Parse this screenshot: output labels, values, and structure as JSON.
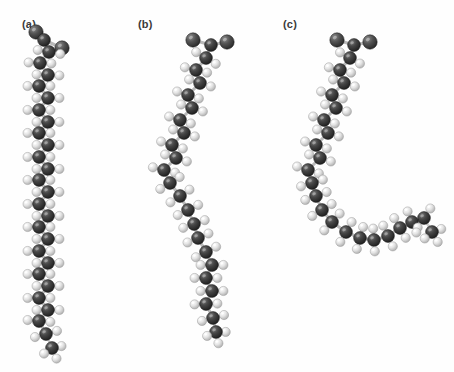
{
  "figure": {
    "background_color": "#fefefe",
    "width": 454,
    "height": 372,
    "panels": [
      {
        "id": "a",
        "label": "(a)",
        "label_x": 22,
        "label_y": 18
      },
      {
        "id": "b",
        "label": "(b)",
        "label_x": 138,
        "label_y": 18
      },
      {
        "id": "c",
        "label": "(c)",
        "label_x": 283,
        "label_y": 18
      }
    ]
  },
  "legend": {
    "carbon_color": "#3b3b3b",
    "hydrogen_color": "#e2e2e2",
    "oxygen_color": "#4a4a4a",
    "bond_color": "#b9b9b9"
  },
  "chart_data": {
    "type": "scatter",
    "title": "",
    "xlabel": "",
    "ylabel": "",
    "grid": false,
    "legend_position": "none",
    "models": [
      {
        "panel": "a",
        "description": "straight extended saturated fatty acid chain",
        "carbon_backbone": [
          [
            44,
            40
          ],
          [
            49,
            52
          ],
          [
            40,
            63
          ],
          [
            48,
            75
          ],
          [
            39,
            86
          ],
          [
            48,
            98
          ],
          [
            39,
            110
          ],
          [
            48,
            122
          ],
          [
            39,
            133
          ],
          [
            48,
            145
          ],
          [
            39,
            157
          ],
          [
            48,
            169
          ],
          [
            39,
            180
          ],
          [
            48,
            192
          ],
          [
            39,
            204
          ],
          [
            48,
            216
          ],
          [
            39,
            227
          ],
          [
            48,
            239
          ],
          [
            39,
            251
          ],
          [
            48,
            263
          ],
          [
            39,
            274
          ],
          [
            48,
            286
          ],
          [
            39,
            298
          ],
          [
            48,
            310
          ],
          [
            39,
            321
          ],
          [
            46,
            334
          ]
        ],
        "head_group": [
          [
            36,
            32
          ],
          [
            62,
            48
          ]
        ],
        "terminal": [
          52,
          348
        ]
      },
      {
        "panel": "b",
        "description": "monounsaturated fatty acid with a single cis kink",
        "carbon_backbone": [
          [
            211,
            45
          ],
          [
            206,
            58
          ],
          [
            196,
            70
          ],
          [
            200,
            83
          ],
          [
            188,
            95
          ],
          [
            192,
            108
          ],
          [
            180,
            120
          ],
          [
            184,
            133
          ],
          [
            172,
            145
          ],
          [
            176,
            158
          ],
          [
            164,
            170
          ],
          [
            170,
            183
          ],
          [
            180,
            196
          ],
          [
            188,
            210
          ],
          [
            194,
            224
          ],
          [
            198,
            238
          ],
          [
            206,
            252
          ],
          [
            212,
            265
          ],
          [
            206,
            278
          ],
          [
            212,
            291
          ],
          [
            206,
            304
          ],
          [
            213,
            318
          ]
        ],
        "head_group": [
          [
            193,
            40
          ],
          [
            227,
            42
          ]
        ],
        "terminal": [
          216,
          332
        ]
      },
      {
        "panel": "c",
        "description": "polyunsaturated fatty acid with two cis kinks",
        "carbon_backbone": [
          [
            354,
            45
          ],
          [
            350,
            58
          ],
          [
            340,
            70
          ],
          [
            344,
            83
          ],
          [
            332,
            95
          ],
          [
            336,
            108
          ],
          [
            324,
            120
          ],
          [
            328,
            133
          ],
          [
            316,
            145
          ],
          [
            320,
            158
          ],
          [
            308,
            170
          ],
          [
            312,
            183
          ],
          [
            316,
            196
          ],
          [
            322,
            210
          ],
          [
            332,
            222
          ],
          [
            346,
            232
          ],
          [
            360,
            238
          ],
          [
            374,
            240
          ],
          [
            388,
            236
          ],
          [
            400,
            228
          ],
          [
            412,
            222
          ],
          [
            424,
            218
          ]
        ],
        "head_group": [
          [
            337,
            40
          ],
          [
            370,
            42
          ]
        ],
        "terminal": [
          432,
          232
        ]
      }
    ]
  }
}
